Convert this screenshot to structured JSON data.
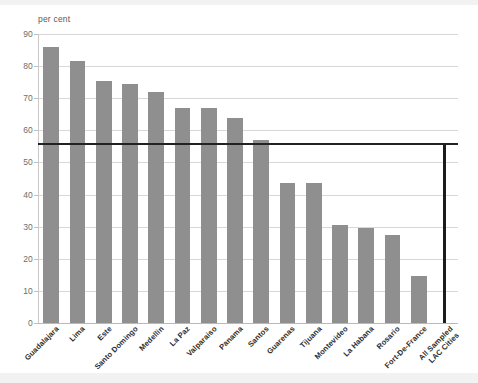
{
  "unit_label": "per cent",
  "colors": {
    "bar": "#8f8f8f",
    "highlight_bar": "#1c1c1c",
    "reference_line": "#222222",
    "grid": "#d8d8d8",
    "text": "#2e2e2e"
  },
  "chart_data": {
    "type": "bar",
    "title": "",
    "subtitle": "",
    "xlabel": "",
    "ylabel": "per cent",
    "ylim": [
      0,
      90
    ],
    "yticks": [
      0,
      10,
      20,
      30,
      40,
      50,
      60,
      70,
      80,
      90
    ],
    "grid": true,
    "legend": "none",
    "reference_line": {
      "label": "All Sampled LAC Cities",
      "value": 56
    },
    "categories": [
      "Guadalajara",
      "Lima",
      "Este",
      "Santo Domingo",
      "Medellin",
      "La Paz",
      "Valparaiso",
      "Panama",
      "Santos",
      "Guarenas",
      "Tijuana",
      "Montevideo",
      "La Habana",
      "Rosario",
      "Fort-De-France",
      "All Sampled LAC Cities"
    ],
    "category_lines": [
      [
        "Guadalajara"
      ],
      [
        "Lima"
      ],
      [
        "Este"
      ],
      [
        "Santo Domingo"
      ],
      [
        "Medellin"
      ],
      [
        "La Paz"
      ],
      [
        "Valparaiso"
      ],
      [
        "Panama"
      ],
      [
        "Santos"
      ],
      [
        "Guarenas"
      ],
      [
        "Tijuana"
      ],
      [
        "Montevideo"
      ],
      [
        "La Habana"
      ],
      [
        "Rosario"
      ],
      [
        "Fort-De-France"
      ],
      [
        "All Sampled",
        "LAC Cities"
      ]
    ],
    "values": [
      86,
      81.5,
      75.5,
      74.5,
      72,
      67,
      67,
      64,
      57,
      43.5,
      43.5,
      30.5,
      29.5,
      27.5,
      14.5,
      56
    ],
    "highlight_index": 15
  }
}
